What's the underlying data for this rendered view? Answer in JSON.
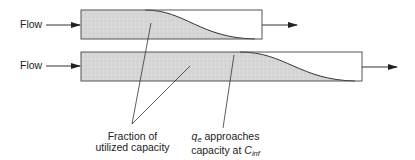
{
  "diagram": {
    "type": "adsorption-column-mass-transfer-zone",
    "inlet_labels": [
      "Flow",
      "Flow"
    ],
    "columns": [
      {
        "name": "short-column",
        "x": 81,
        "y": 10,
        "w": 181,
        "h": 29,
        "front_start_x": 145,
        "front_end_x": 255
      },
      {
        "name": "long-column",
        "x": 81,
        "y": 52,
        "w": 281,
        "h": 29,
        "front_start_x": 240,
        "front_end_x": 355
      }
    ],
    "annotations": {
      "fraction": {
        "line1": "Fraction of",
        "line2": "utilized capacity"
      },
      "qe": {
        "symbol": "q",
        "symbol_sub": "e",
        "line1_rest": " approaches",
        "line2_prefix": "capacity at ",
        "line2_symbol": "C",
        "line2_sub": "inf"
      }
    },
    "colors": {
      "fill": "#d4d4d4",
      "stroke": "#4a4a4a",
      "text": "#222222"
    }
  }
}
